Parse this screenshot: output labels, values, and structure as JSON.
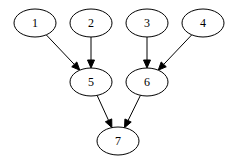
{
  "diagram": {
    "type": "directed-graph",
    "background": "#ffffff",
    "stroke_color": "#000000",
    "node_shape": "ellipse",
    "node_rx": 21,
    "node_ry": 14,
    "nodes": [
      {
        "id": "1",
        "label": "1",
        "cx": 35,
        "cy": 23
      },
      {
        "id": "2",
        "label": "2",
        "cx": 91,
        "cy": 23
      },
      {
        "id": "3",
        "label": "3",
        "cx": 147,
        "cy": 23
      },
      {
        "id": "4",
        "label": "4",
        "cx": 203,
        "cy": 23
      },
      {
        "id": "5",
        "label": "5",
        "cx": 91,
        "cy": 82
      },
      {
        "id": "6",
        "label": "6",
        "cx": 147,
        "cy": 82
      },
      {
        "id": "7",
        "label": "7",
        "cx": 118,
        "cy": 141
      }
    ],
    "edges": [
      {
        "from": "1",
        "to": "5"
      },
      {
        "from": "2",
        "to": "5"
      },
      {
        "from": "3",
        "to": "6"
      },
      {
        "from": "4",
        "to": "6"
      },
      {
        "from": "5",
        "to": "7"
      },
      {
        "from": "6",
        "to": "7"
      }
    ]
  }
}
